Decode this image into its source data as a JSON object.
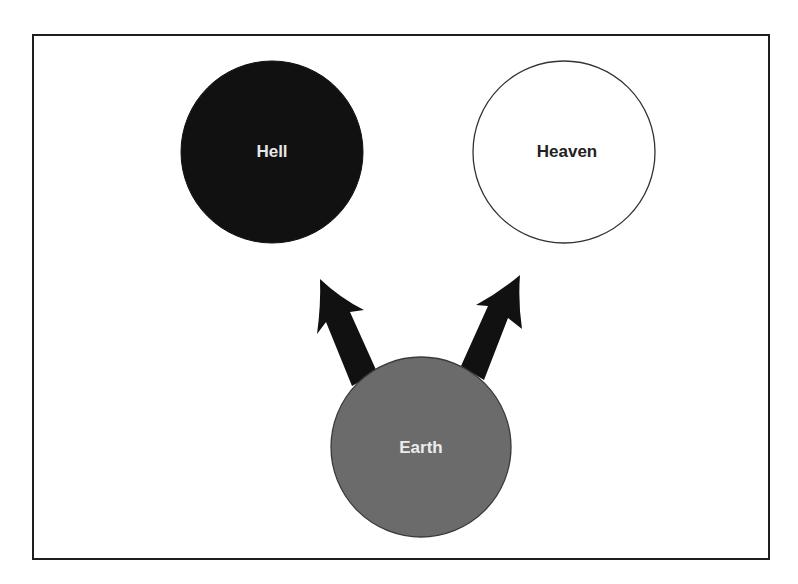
{
  "diagram": {
    "nodes": [
      {
        "id": "hell",
        "label": "Hell",
        "fill": "#111111",
        "stroke": "#111111",
        "text_color": "#e6e6e6",
        "cx": 272,
        "cy": 152,
        "r": 91
      },
      {
        "id": "heaven",
        "label": "Heaven",
        "fill": "#ffffff",
        "stroke": "#333333",
        "text_color": "#222222",
        "cx": 564,
        "cy": 152,
        "r": 91
      },
      {
        "id": "earth",
        "label": "Earth",
        "fill": "#6b6b6b",
        "stroke": "#3a3a3a",
        "text_color": "#ececec",
        "cx": 421,
        "cy": 447,
        "r": 90
      }
    ],
    "edges": [
      {
        "from": "earth",
        "to": "hell",
        "color": "#111111"
      },
      {
        "from": "earth",
        "to": "heaven",
        "color": "#111111"
      }
    ]
  }
}
